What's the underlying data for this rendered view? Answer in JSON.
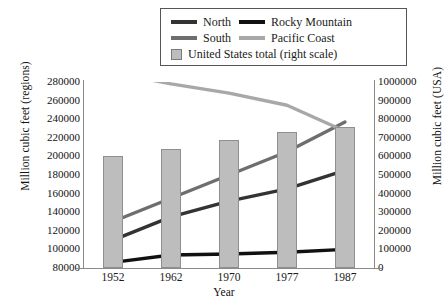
{
  "chart_data": {
    "type": "bar",
    "title": "",
    "xlabel": "Year",
    "ylabel": "Million cubic feet (regions)",
    "ylabel_right": "Million cubic feet (USA)",
    "categories": [
      "1952",
      "1962",
      "1970",
      "1977",
      "1987"
    ],
    "x_numeric": [
      1952,
      1962,
      1970,
      1977,
      1987
    ],
    "ylim": [
      80000,
      280000
    ],
    "ylim_right": [
      0,
      1000000
    ],
    "yticks": [
      "80000",
      "100000",
      "120000",
      "140000",
      "160000",
      "180000",
      "200000",
      "220000",
      "240000",
      "260000",
      "280000"
    ],
    "yticks_right": [
      "0",
      "100000",
      "200000",
      "300000",
      "400000",
      "500000",
      "600000",
      "700000",
      "800000",
      "900000",
      "1000000"
    ],
    "grid": false,
    "legend_position": "top-center",
    "series": [
      {
        "name": "North",
        "axis": "left",
        "type": "line",
        "color": "#333333",
        "values": [
          110000,
          135000,
          152000,
          165000,
          185000
        ]
      },
      {
        "name": "Rocky Mountain",
        "axis": "left",
        "type": "line",
        "color": "#111111",
        "values": [
          86000,
          94000,
          95000,
          97000,
          100000
        ]
      },
      {
        "name": "South",
        "axis": "left",
        "type": "line",
        "color": "#6e6e6e",
        "values": [
          130000,
          155000,
          180000,
          205000,
          237000
        ]
      },
      {
        "name": "Pacific Coast",
        "axis": "left",
        "type": "line",
        "color": "#a8a8a8",
        "values": [
          290000,
          278000,
          268000,
          255000,
          227000
        ]
      },
      {
        "name": "United States total (right scale)",
        "axis": "right",
        "type": "bar",
        "color": "#bdbdbd",
        "values": [
          600000,
          640000,
          690000,
          730000,
          760000
        ]
      }
    ]
  },
  "legend": {
    "entries": [
      {
        "label": "North",
        "swatch": "line-swatch-north"
      },
      {
        "label": "Rocky Mountain",
        "swatch": "line-swatch-rocky-mountain"
      },
      {
        "label": "South",
        "swatch": "line-swatch-south"
      },
      {
        "label": "Pacific Coast",
        "swatch": "line-swatch-pacific-coast"
      },
      {
        "label": "United States total (right scale)",
        "swatch": "box-swatch-us-total"
      }
    ]
  }
}
